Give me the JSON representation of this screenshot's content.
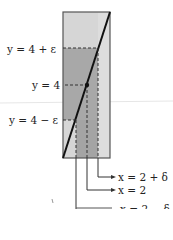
{
  "figure": {
    "type": "epsilon-delta limit diagram",
    "colors": {
      "background": "#ffffff",
      "rect_light": "#d4d4d4",
      "band_mid": "#a9a9a9",
      "band_overlap": "#9a9a9a",
      "right_strip": "#dcdcdc",
      "outline": "#555555",
      "line": "#111111",
      "dash": "#333333"
    },
    "labels": {
      "y_upper": "y = 4 + ε",
      "y_center": "y = 4",
      "y_lower": "y = 4 − ε",
      "x_upper": "x = 2 + δ",
      "x_center": "x = 2",
      "x_lower": "x = 2 − δ"
    },
    "point": {
      "x": 2,
      "y": 4
    }
  }
}
